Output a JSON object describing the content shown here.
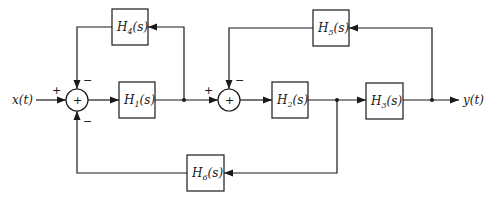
{
  "diagram": {
    "type": "block-diagram",
    "input_label": "x(t)",
    "output_label": "y(t)",
    "blocks": [
      {
        "id": "H1",
        "name": "H",
        "sub": "1",
        "arg": "(s)",
        "label": "H1(s)"
      },
      {
        "id": "H2",
        "name": "H",
        "sub": "2",
        "arg": "(s)",
        "label": "H2(s)"
      },
      {
        "id": "H3",
        "name": "H",
        "sub": "3",
        "arg": "(s)",
        "label": "H3(s)"
      },
      {
        "id": "H4",
        "name": "H",
        "sub": "4",
        "arg": "(s)",
        "label": "H4(s)"
      },
      {
        "id": "H5",
        "name": "H",
        "sub": "5",
        "arg": "(s)",
        "label": "H5(s)"
      },
      {
        "id": "H6",
        "name": "H",
        "sub": "6",
        "arg": "(s)",
        "label": "H6(s)"
      }
    ],
    "summers": [
      {
        "id": "S1",
        "symbol": "+",
        "input_signs": {
          "left": "+",
          "top": "−",
          "bottom": "−"
        }
      },
      {
        "id": "S2",
        "symbol": "+",
        "input_signs": {
          "left": "+",
          "top": "−"
        }
      }
    ],
    "connections": [
      "x(t) -> S1 (+)",
      "S1 -> H1",
      "H1 -> S2 (+)",
      "H1 output -> H4 -> S1 (−)",
      "S2 -> H2",
      "H2 -> H3",
      "H2 output -> H6 -> S1 (−)",
      "H3 -> y(t)",
      "H3 output -> H5 -> S2 (−)"
    ]
  }
}
